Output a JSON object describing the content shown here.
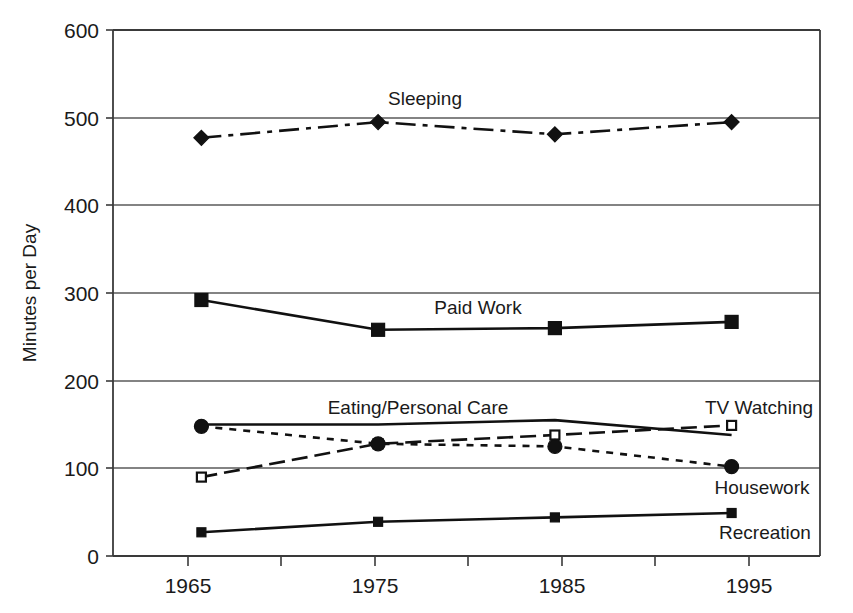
{
  "chart_data": {
    "type": "line",
    "title": "",
    "xlabel": "",
    "ylabel": "Minutes per Day",
    "x": [
      1965,
      1975,
      1985,
      1995
    ],
    "xticklabels": [
      "1965",
      "1975",
      "1985",
      "1995"
    ],
    "xlim": [
      1960,
      2000
    ],
    "ylim": [
      0,
      600
    ],
    "yticks": [
      0,
      100,
      200,
      300,
      400,
      500,
      600
    ],
    "yticklabels": [
      "0",
      "100",
      "200",
      "300",
      "400",
      "500",
      "600"
    ],
    "grid": "horizontal",
    "legend_position": "inline-labels",
    "series": [
      {
        "name": "Sleeping",
        "values": [
          477,
          495,
          481,
          495
        ],
        "linestyle": "dash-dot",
        "marker": "diamond-filled",
        "label_x": 1975,
        "label_y": 520
      },
      {
        "name": "Paid Work",
        "values": [
          292,
          258,
          260,
          267
        ],
        "linestyle": "solid",
        "marker": "square-filled",
        "label_x": 1978,
        "label_y": 287
      },
      {
        "name": "Eating/Personal Care",
        "values": [
          150,
          150,
          155,
          138
        ],
        "linestyle": "solid",
        "marker": "none",
        "label_x": 1975,
        "label_y": 180
      },
      {
        "name": "TV Watching",
        "values": [
          90,
          128,
          138,
          149
        ],
        "linestyle": "dashed",
        "marker": "square-open",
        "label_x": 1994,
        "label_y": 180
      },
      {
        "name": "Housework",
        "values": [
          148,
          128,
          125,
          102
        ],
        "linestyle": "dotted",
        "marker": "circle-filled",
        "label_x": 1994,
        "label_y": 85
      },
      {
        "name": "Recreation",
        "values": [
          27,
          39,
          44,
          49
        ],
        "linestyle": "solid",
        "marker": "square-small-filled",
        "label_x": 1994,
        "label_y": 35
      }
    ]
  },
  "axes": {
    "y_title": "Minutes per Day",
    "y_ticks": [
      "600",
      "500",
      "400",
      "300",
      "200",
      "100",
      "0"
    ],
    "x_ticks": [
      "1965",
      "1975",
      "1985",
      "1995"
    ]
  },
  "labels": {
    "sleeping": "Sleeping",
    "paid_work": "Paid Work",
    "eating": "Eating/Personal Care",
    "tv_watching": "TV Watching",
    "housework": "Housework",
    "recreation": "Recreation"
  },
  "colors": {
    "ink": "#111111",
    "grid": "#5a5a5a",
    "background": "#ffffff"
  }
}
